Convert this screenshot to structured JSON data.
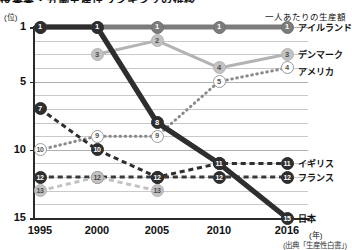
{
  "title": "授業業・労働生産性ランキングの推移",
  "axis": {
    "y_unit": "(位)",
    "y_ticks": [
      "1",
      "5",
      "10",
      "15"
    ],
    "x_ticks": [
      "1995",
      "2000",
      "2005",
      "2010",
      "2016"
    ],
    "x_unit": "(年)"
  },
  "caption_top": "一人あたりの生産額",
  "source": "(出典「生産性白書」)",
  "colors": {
    "dark": "#2e2e2e",
    "mid": "#7c7c7c",
    "light": "#c2c2c2",
    "grid": "#c9c9c9",
    "axis": "#2a2a2a"
  },
  "chart_data": {
    "type": "line",
    "title": "授業業・労働生産性ランキングの推移",
    "xlabel": "(年)",
    "ylabel": "(位)",
    "x": [
      1995,
      2000,
      2005,
      2010,
      2016
    ],
    "ylim": [
      1,
      15
    ],
    "y_inverted": true,
    "grid": true,
    "legend": "right-of-plot",
    "annotation": "一人あたりの生産額",
    "source": "(出典「生産性白書」)",
    "series": [
      {
        "name": "アイルランド",
        "style": "solid",
        "color": "#7c7c7c",
        "width": "thick",
        "x": [
          1995,
          2000,
          2005,
          2010,
          2016
        ],
        "values": [
          1,
          1,
          1,
          1,
          1
        ],
        "labels": [
          "1",
          "1",
          "1",
          "1",
          "1"
        ]
      },
      {
        "name": "デンマーク",
        "style": "solid",
        "color": "#b3b3b3",
        "width": "medium",
        "x": [
          2000,
          2005,
          2010,
          2016
        ],
        "values": [
          3,
          2,
          4,
          3
        ],
        "labels": [
          "3",
          "2",
          "4",
          "3"
        ]
      },
      {
        "name": "アメリカ",
        "style": "dotted",
        "color": "#8a8a8a",
        "width": "medium",
        "x": [
          1995,
          2000,
          2005,
          2010,
          2016
        ],
        "values": [
          10,
          9,
          9,
          5,
          4
        ],
        "labels": [
          "10",
          "9",
          "9",
          "5",
          "4"
        ]
      },
      {
        "name": "イギリス",
        "style": "dashed",
        "color": "#2e2e2e",
        "width": "medium",
        "x": [
          1995,
          2000,
          2005,
          2010,
          2016
        ],
        "values": [
          7,
          10,
          12,
          11,
          11
        ],
        "labels": [
          "7",
          "10",
          "12",
          "11",
          "11"
        ]
      },
      {
        "name": "フランス",
        "style": "dashed",
        "color": "#3a3a3a",
        "width": "medium",
        "x": [
          1995,
          2000,
          2005,
          2010,
          2016
        ],
        "values": [
          12,
          12,
          12,
          12,
          12
        ],
        "labels": [
          "12",
          "12",
          "12",
          "12",
          "12"
        ]
      },
      {
        "name": "日本",
        "style": "solid",
        "color": "#2e2e2e",
        "width": "thick",
        "x": [
          1995,
          2000,
          2005,
          2010,
          2016
        ],
        "values": [
          1,
          1,
          8,
          11,
          15
        ],
        "labels": [
          "1",
          "1",
          "8",
          "11",
          "15"
        ]
      },
      {
        "name": "日本(下段)",
        "style": "dashed",
        "color": "#c2c2c2",
        "width": "medium",
        "x": [
          1995,
          2000,
          2005
        ],
        "values": [
          13,
          12,
          13
        ],
        "labels": [
          "13",
          "12",
          "13"
        ]
      }
    ]
  },
  "legend_labels": [
    {
      "rank": "1",
      "name": "アイルランド"
    },
    {
      "rank": "3",
      "name": "デンマーク"
    },
    {
      "rank": "4",
      "name": "アメリカ"
    },
    {
      "rank": "11",
      "name": "イギリス"
    },
    {
      "rank": "12",
      "name": "フランス"
    },
    {
      "rank": "15",
      "name": "日本"
    }
  ]
}
